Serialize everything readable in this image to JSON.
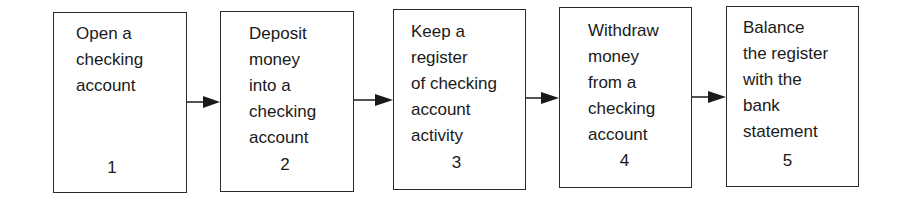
{
  "diagram": {
    "type": "flowchart",
    "direction": "left-to-right",
    "steps": [
      {
        "number": "1",
        "text": "Open a\nchecking\naccount"
      },
      {
        "number": "2",
        "text": "Deposit\nmoney\ninto a\nchecking\naccount"
      },
      {
        "number": "3",
        "text": "Keep a\nregister\nof checking\naccount\nactivity"
      },
      {
        "number": "4",
        "text": "Withdraw\nmoney\nfrom a\nchecking\naccount"
      },
      {
        "number": "5",
        "text": "Balance\nthe register\nwith the\nbank\nstatement"
      }
    ],
    "connections": [
      {
        "from": "1",
        "to": "2"
      },
      {
        "from": "2",
        "to": "3"
      },
      {
        "from": "3",
        "to": "4"
      },
      {
        "from": "4",
        "to": "5"
      }
    ]
  }
}
